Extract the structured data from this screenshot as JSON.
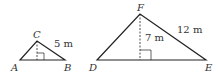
{
  "diagram": {
    "triangles": [
      {
        "name": "ABC",
        "vertices": {
          "A": "A",
          "B": "B",
          "C": "C"
        },
        "side_label": "5 m",
        "height_label": ""
      },
      {
        "name": "DEF",
        "vertices": {
          "D": "D",
          "E": "E",
          "F": "F"
        },
        "side_label": "12 m",
        "height_label": "7 m"
      }
    ],
    "colors": {
      "stroke": "#222222",
      "text": "#333333"
    }
  }
}
